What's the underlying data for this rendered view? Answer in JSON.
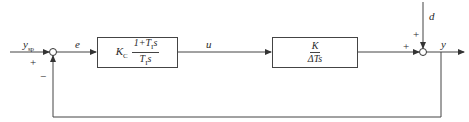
{
  "diagram": {
    "type": "feedback-control-block-diagram",
    "signals": {
      "setpoint": "y_sp",
      "error": "e",
      "control": "u",
      "disturbance": "d",
      "output": "y"
    },
    "signal_labels": {
      "setpoint_main": "y",
      "setpoint_sub": "sp",
      "error": "e",
      "control": "u",
      "disturbance": "d",
      "output": "y"
    },
    "blocks": [
      {
        "id": "controller",
        "gain": "K",
        "gain_sub": "C",
        "numerator": "1+T",
        "numerator_sub": "I",
        "numerator_tail": "s",
        "denominator": "T",
        "denominator_sub": "I",
        "denominator_tail": "s"
      },
      {
        "id": "process",
        "numerator": "K",
        "denominator": "ΔTs"
      }
    ],
    "summing_junctions": [
      {
        "id": "sum1",
        "signs": {
          "left": "+",
          "bottom": "−"
        }
      },
      {
        "id": "sum2",
        "signs": {
          "left": "+",
          "top": "+"
        }
      }
    ],
    "colors": {
      "line": "#444444",
      "background": "#ffffff"
    }
  }
}
